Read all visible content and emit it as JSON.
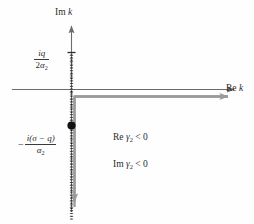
{
  "figure": {
    "colors": {
      "axis": "#6b6b6b",
      "contour": "#8f8f8f",
      "branch_cut": "#1a1a1a",
      "pole": "#111111",
      "text": "#2b2b2b",
      "background": "#fefefe"
    },
    "axes": {
      "imaginary_label": {
        "prefix": "Im",
        "variable": "k"
      },
      "real_label": {
        "prefix": "Re",
        "variable": "k"
      }
    },
    "markers": {
      "branch_point_label": {
        "numerator_i": "i",
        "numerator_q": "q",
        "denominator_2": "2",
        "denominator_alpha": "α",
        "denominator_sub": "2",
        "full_text": "iq / 2α2"
      },
      "pole_label": {
        "sign": "−",
        "numerator": "i(σ − q)",
        "denominator_alpha": "α",
        "denominator_sub": "2",
        "full_text": "− i(σ − q) / α2"
      }
    },
    "conditions": [
      {
        "prefix": "Re",
        "variable": "γ",
        "subscript": "2",
        "relation": "< 0"
      },
      {
        "prefix": "Im",
        "variable": "γ",
        "subscript": "2",
        "relation": "< 0"
      }
    ]
  }
}
